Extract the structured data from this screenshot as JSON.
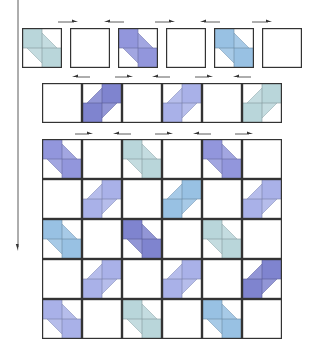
{
  "colors": {
    "teal": "#b9d6da",
    "purple": "#9296dc",
    "blue": "#98c1e3",
    "darkpurple": "#7f84cf",
    "lightpurple": "#a9b1e8",
    "border": "#333333",
    "arrow": "#333333"
  },
  "top_row": {
    "tiles": [
      {
        "x": 22,
        "y": 28,
        "type": "down",
        "color": "teal"
      },
      {
        "x": 70,
        "y": 28,
        "type": "empty",
        "color": ""
      },
      {
        "x": 118,
        "y": 28,
        "type": "down",
        "color": "purple"
      },
      {
        "x": 166,
        "y": 28,
        "type": "empty",
        "color": ""
      },
      {
        "x": 214,
        "y": 28,
        "type": "down",
        "color": "blue"
      },
      {
        "x": 262,
        "y": 28,
        "type": "empty",
        "color": ""
      }
    ],
    "arrows": [
      {
        "x": 58,
        "y": 19,
        "w": 20,
        "dir": "right"
      },
      {
        "x": 104,
        "y": 19,
        "w": 20,
        "dir": "left"
      },
      {
        "x": 155,
        "y": 19,
        "w": 20,
        "dir": "right"
      },
      {
        "x": 200,
        "y": 19,
        "w": 20,
        "dir": "left"
      },
      {
        "x": 252,
        "y": 19,
        "w": 20,
        "dir": "right"
      }
    ]
  },
  "second_row": {
    "x": 42,
    "y": 83,
    "tiles": [
      {
        "type": "empty",
        "color": ""
      },
      {
        "type": "up",
        "color": "darkpurple"
      },
      {
        "type": "empty",
        "color": ""
      },
      {
        "type": "up",
        "color": "lightpurple"
      },
      {
        "type": "empty",
        "color": ""
      },
      {
        "type": "up",
        "color": "teal"
      }
    ],
    "arrows": [
      {
        "x": 72,
        "y": 74,
        "w": 18,
        "dir": "left"
      },
      {
        "x": 115,
        "y": 74,
        "w": 18,
        "dir": "right"
      },
      {
        "x": 152,
        "y": 74,
        "w": 18,
        "dir": "left"
      },
      {
        "x": 195,
        "y": 74,
        "w": 18,
        "dir": "right"
      },
      {
        "x": 233,
        "y": 74,
        "w": 18,
        "dir": "left"
      }
    ]
  },
  "grid": {
    "x": 42,
    "y": 139,
    "cols": 6,
    "rows": 5,
    "cells": [
      [
        {
          "type": "down",
          "color": "purple"
        },
        {
          "type": "empty",
          "color": ""
        },
        {
          "type": "down",
          "color": "teal"
        },
        {
          "type": "empty",
          "color": ""
        },
        {
          "type": "down",
          "color": "purple"
        },
        {
          "type": "empty",
          "color": ""
        }
      ],
      [
        {
          "type": "empty",
          "color": ""
        },
        {
          "type": "up",
          "color": "lightpurple"
        },
        {
          "type": "empty",
          "color": ""
        },
        {
          "type": "up",
          "color": "blue"
        },
        {
          "type": "empty",
          "color": ""
        },
        {
          "type": "up",
          "color": "lightpurple"
        }
      ],
      [
        {
          "type": "down",
          "color": "blue"
        },
        {
          "type": "empty",
          "color": ""
        },
        {
          "type": "down",
          "color": "darkpurple"
        },
        {
          "type": "empty",
          "color": ""
        },
        {
          "type": "down",
          "color": "teal"
        },
        {
          "type": "empty",
          "color": ""
        }
      ],
      [
        {
          "type": "empty",
          "color": ""
        },
        {
          "type": "up",
          "color": "lightpurple"
        },
        {
          "type": "empty",
          "color": ""
        },
        {
          "type": "up",
          "color": "lightpurple"
        },
        {
          "type": "empty",
          "color": ""
        },
        {
          "type": "up",
          "color": "darkpurple"
        }
      ],
      [
        {
          "type": "down",
          "color": "lightpurple"
        },
        {
          "type": "empty",
          "color": ""
        },
        {
          "type": "down",
          "color": "teal"
        },
        {
          "type": "empty",
          "color": ""
        },
        {
          "type": "down",
          "color": "blue"
        },
        {
          "type": "empty",
          "color": ""
        }
      ]
    ],
    "arrows": [
      {
        "x": 75,
        "y": 131,
        "w": 18,
        "dir": "right"
      },
      {
        "x": 113,
        "y": 131,
        "w": 18,
        "dir": "left"
      },
      {
        "x": 155,
        "y": 131,
        "w": 18,
        "dir": "right"
      },
      {
        "x": 193,
        "y": 131,
        "w": 18,
        "dir": "left"
      },
      {
        "x": 235,
        "y": 131,
        "w": 18,
        "dir": "right"
      }
    ]
  },
  "vertical_arrow": {
    "x": 18,
    "y1": 59,
    "y2": 310,
    "dir": "down"
  }
}
